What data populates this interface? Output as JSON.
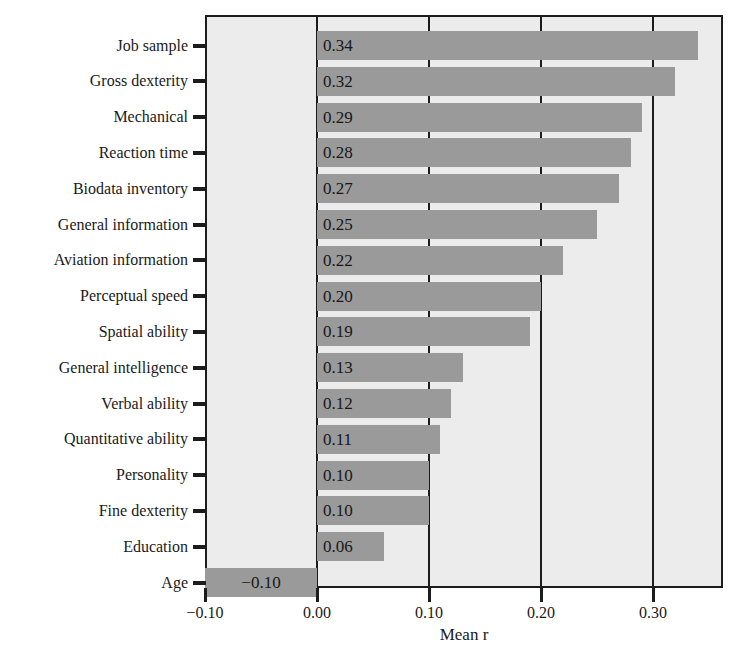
{
  "chart_data": {
    "type": "bar",
    "orientation": "horizontal",
    "title": "",
    "xlabel": "Mean r",
    "ylabel": "",
    "xlim": [
      -0.125,
      0.337
    ],
    "xticks": [
      -0.1,
      0.0,
      0.1,
      0.2,
      0.3
    ],
    "xtick_labels": [
      "−0.10",
      "0.00",
      "0.10",
      "0.20",
      "0.30"
    ],
    "grid": "vertical",
    "legend": "none",
    "bar_color": "#9a9a9a",
    "plot_background": "#ececec",
    "axis_color": "#1c1c1c",
    "categories": [
      "Job sample",
      "Gross dexterity",
      "Mechanical",
      "Reaction time",
      "Biodata inventory",
      "General information",
      "Aviation information",
      "Perceptual speed",
      "Spatial ability",
      "General intelligence",
      "Verbal ability",
      "Quantitative ability",
      "Personality",
      "Fine dexterity",
      "Education",
      "Age"
    ],
    "values": [
      0.34,
      0.32,
      0.29,
      0.28,
      0.27,
      0.25,
      0.22,
      0.2,
      0.19,
      0.13,
      0.12,
      0.11,
      0.1,
      0.1,
      0.06,
      -0.1
    ],
    "value_labels": [
      "0.34",
      "0.32",
      "0.29",
      "0.28",
      "0.27",
      "0.25",
      "0.22",
      "0.20",
      "0.19",
      "0.13",
      "0.12",
      "0.11",
      "0.10",
      "0.10",
      "0.06",
      "−0.10"
    ]
  }
}
